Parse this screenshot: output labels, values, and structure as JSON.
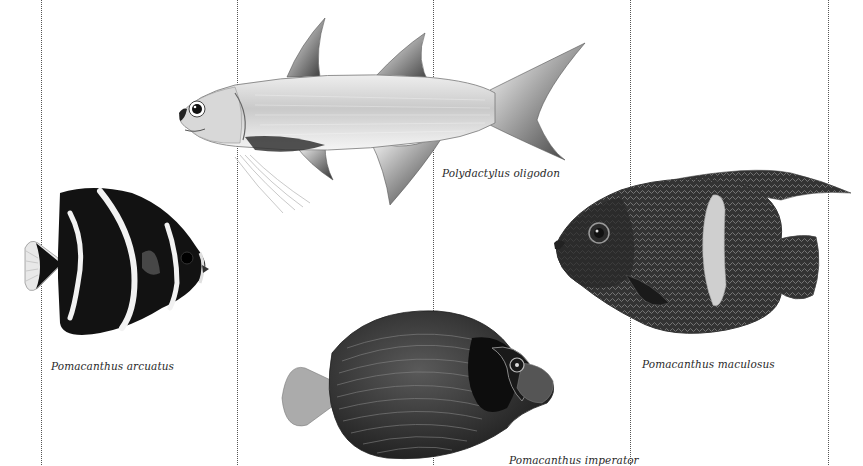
{
  "plate": {
    "background_color": "#ffffff",
    "divider_color": "#555555",
    "divider_positions_x": [
      41,
      237,
      433,
      630,
      828
    ]
  },
  "specimens": [
    {
      "id": "arcuatus",
      "caption": "Pomacanthus arcuatus",
      "body_color": "#111111",
      "stripe_color": "#f2f2f2"
    },
    {
      "id": "oligodon",
      "caption": "Polydactylus oligodon",
      "body_color": "#cfcfcf",
      "fin_color": "#3a3a3a"
    },
    {
      "id": "imperator",
      "caption": "Pomacanthus imperator",
      "body_color": "#2e2e2e",
      "tail_color": "#a8a8a8"
    },
    {
      "id": "maculosus",
      "caption": "Pomacanthus maculosus",
      "body_color": "#3a3a3a",
      "patch_color": "#d0d0d0"
    }
  ]
}
